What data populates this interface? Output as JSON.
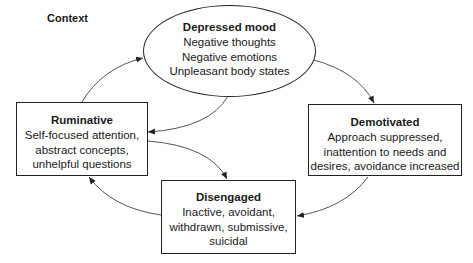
{
  "diagram": {
    "context_label": "Context",
    "nodes": {
      "depressed_mood": {
        "title": "Depressed mood",
        "lines": [
          "Negative thoughts",
          "Negative emotions",
          "Unpleasant body states"
        ],
        "shape": "ellipse"
      },
      "ruminative": {
        "title": "Ruminative",
        "lines": [
          "Self-focused attention,",
          "abstract concepts,",
          "unhelpful questions"
        ],
        "shape": "rectangle"
      },
      "demotivated": {
        "title": "Demotivated",
        "lines": [
          "Approach suppressed,",
          "inattention to needs and",
          "desires, avoidance increased"
        ],
        "shape": "rectangle"
      },
      "disengaged": {
        "title": "Disengaged",
        "lines": [
          "Inactive, avoidant,",
          "withdrawn, submissive,",
          "suicidal"
        ],
        "shape": "rectangle"
      }
    },
    "edges": [
      {
        "from": "depressed_mood",
        "to": "demotivated"
      },
      {
        "from": "demotivated",
        "to": "disengaged"
      },
      {
        "from": "disengaged",
        "to": "ruminative"
      },
      {
        "from": "ruminative",
        "to": "depressed_mood"
      },
      {
        "from": "depressed_mood",
        "to": "ruminative"
      },
      {
        "from": "ruminative",
        "to": "disengaged"
      }
    ],
    "colors": {
      "stroke": "#222222",
      "arrow": "#444444",
      "background": "#ffffff"
    }
  }
}
